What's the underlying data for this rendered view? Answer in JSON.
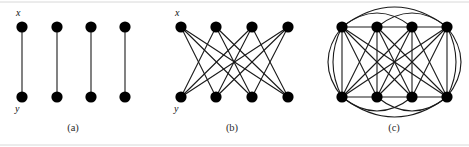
{
  "figure": {
    "width": 469,
    "height": 147,
    "background": "#ffffff",
    "edge_color": "#1a1a1a",
    "node_color": "#000000",
    "node_radius": 5.6,
    "edge_width": 1.1,
    "rule_color": "#d8d8d8"
  },
  "panels": [
    {
      "id": "a",
      "caption": "(a)",
      "caption_x": 73,
      "caption_y": 131,
      "description": "perfect matching: four disjoint vertical edges",
      "labels": [
        {
          "text": "x",
          "x": 16,
          "y": 16,
          "for": "top-left-node"
        },
        {
          "text": "y",
          "x": 15,
          "y": 112,
          "for": "bottom-left-node"
        }
      ],
      "top_nodes": [
        {
          "x": 22,
          "y": 27
        },
        {
          "x": 57,
          "y": 27
        },
        {
          "x": 91,
          "y": 27
        },
        {
          "x": 125,
          "y": 27
        }
      ],
      "bottom_nodes": [
        {
          "x": 22,
          "y": 97
        },
        {
          "x": 57,
          "y": 97
        },
        {
          "x": 91,
          "y": 97
        },
        {
          "x": 125,
          "y": 97
        }
      ],
      "straight_edges": [
        {
          "from": "top.0",
          "to": "bottom.0"
        },
        {
          "from": "top.1",
          "to": "bottom.1"
        },
        {
          "from": "top.2",
          "to": "bottom.2"
        },
        {
          "from": "top.3",
          "to": "bottom.3"
        }
      ],
      "arcs": []
    },
    {
      "id": "b",
      "caption": "(b)",
      "caption_x": 232,
      "caption_y": 131,
      "description": "each top vertex joined to the three non-matching bottom vertices",
      "labels": [
        {
          "text": "x",
          "x": 175,
          "y": 16,
          "for": "top-left-node"
        },
        {
          "text": "y",
          "x": 174,
          "y": 112,
          "for": "bottom-left-node"
        }
      ],
      "top_nodes": [
        {
          "x": 181,
          "y": 27
        },
        {
          "x": 216,
          "y": 27
        },
        {
          "x": 252,
          "y": 27
        },
        {
          "x": 288,
          "y": 27
        }
      ],
      "bottom_nodes": [
        {
          "x": 181,
          "y": 97
        },
        {
          "x": 216,
          "y": 97
        },
        {
          "x": 252,
          "y": 97
        },
        {
          "x": 288,
          "y": 97
        }
      ],
      "straight_edges": [
        {
          "from": "top.0",
          "to": "bottom.1"
        },
        {
          "from": "top.0",
          "to": "bottom.2"
        },
        {
          "from": "top.0",
          "to": "bottom.3"
        },
        {
          "from": "top.1",
          "to": "bottom.0"
        },
        {
          "from": "top.1",
          "to": "bottom.2"
        },
        {
          "from": "top.1",
          "to": "bottom.3"
        },
        {
          "from": "top.2",
          "to": "bottom.0"
        },
        {
          "from": "top.2",
          "to": "bottom.1"
        },
        {
          "from": "top.2",
          "to": "bottom.3"
        },
        {
          "from": "top.3",
          "to": "bottom.0"
        },
        {
          "from": "top.3",
          "to": "bottom.1"
        },
        {
          "from": "top.3",
          "to": "bottom.2"
        }
      ],
      "arcs": []
    },
    {
      "id": "c",
      "caption": "(c)",
      "caption_x": 394,
      "caption_y": 131,
      "description": "union of (a) and (b) plus horizontal edges and outer arcs",
      "labels": [],
      "top_nodes": [
        {
          "x": 342,
          "y": 27
        },
        {
          "x": 377,
          "y": 27
        },
        {
          "x": 412,
          "y": 27
        },
        {
          "x": 447,
          "y": 27
        }
      ],
      "bottom_nodes": [
        {
          "x": 342,
          "y": 97
        },
        {
          "x": 377,
          "y": 97
        },
        {
          "x": 412,
          "y": 97
        },
        {
          "x": 447,
          "y": 97
        }
      ],
      "straight_edges": [
        {
          "from": "top.0",
          "to": "bottom.0"
        },
        {
          "from": "top.1",
          "to": "bottom.1"
        },
        {
          "from": "top.2",
          "to": "bottom.2"
        },
        {
          "from": "top.3",
          "to": "bottom.3"
        },
        {
          "from": "top.0",
          "to": "bottom.1"
        },
        {
          "from": "top.0",
          "to": "bottom.2"
        },
        {
          "from": "top.0",
          "to": "bottom.3"
        },
        {
          "from": "top.1",
          "to": "bottom.0"
        },
        {
          "from": "top.1",
          "to": "bottom.2"
        },
        {
          "from": "top.1",
          "to": "bottom.3"
        },
        {
          "from": "top.2",
          "to": "bottom.0"
        },
        {
          "from": "top.2",
          "to": "bottom.1"
        },
        {
          "from": "top.2",
          "to": "bottom.3"
        },
        {
          "from": "top.3",
          "to": "bottom.0"
        },
        {
          "from": "top.3",
          "to": "bottom.1"
        },
        {
          "from": "top.3",
          "to": "bottom.2"
        },
        {
          "from": "top.0",
          "to": "top.1"
        },
        {
          "from": "top.1",
          "to": "top.2"
        },
        {
          "from": "top.2",
          "to": "top.3"
        },
        {
          "from": "bottom.0",
          "to": "bottom.1"
        },
        {
          "from": "bottom.1",
          "to": "bottom.2"
        },
        {
          "from": "bottom.2",
          "to": "bottom.3"
        }
      ],
      "arcs": [
        {
          "from": "top.0",
          "to": "top.3",
          "bulge": -20,
          "side": "top"
        },
        {
          "from": "top.0",
          "to": "top.2",
          "bulge": -14,
          "side": "top"
        },
        {
          "from": "top.1",
          "to": "top.3",
          "bulge": -14,
          "side": "top"
        },
        {
          "from": "bottom.0",
          "to": "bottom.3",
          "bulge": 20,
          "side": "bottom"
        },
        {
          "from": "bottom.0",
          "to": "bottom.2",
          "bulge": 14,
          "side": "bottom"
        },
        {
          "from": "bottom.1",
          "to": "bottom.3",
          "bulge": 14,
          "side": "bottom"
        },
        {
          "from": "top.0",
          "to": "bottom.0",
          "bulge": -14,
          "side": "left"
        },
        {
          "from": "top.0",
          "to": "bottom.0",
          "bulge": -9,
          "side": "left"
        },
        {
          "from": "top.3",
          "to": "bottom.3",
          "bulge": 14,
          "side": "right"
        },
        {
          "from": "top.3",
          "to": "bottom.3",
          "bulge": 9,
          "side": "right"
        }
      ]
    }
  ],
  "rules": [
    {
      "x1": 0,
      "y1": 2,
      "x2": 469,
      "y2": 2
    },
    {
      "x1": 0,
      "y1": 145,
      "x2": 469,
      "y2": 145
    }
  ]
}
